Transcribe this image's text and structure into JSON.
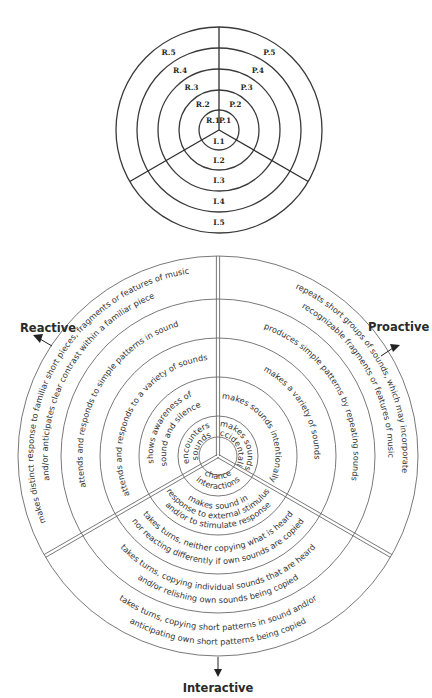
{
  "top_diagram": {
    "center": [
      219,
      130
    ],
    "radii": [
      103,
      82,
      61,
      40,
      20
    ],
    "ring_fills": [
      "#f4f4f4",
      "#ebebeb",
      "#e0e0e0",
      "#d4d4d4",
      "#c9c9c9"
    ],
    "labels": {
      "R": [
        "R.1",
        "R.2",
        "R.3",
        "R.4",
        "R.5"
      ],
      "P": [
        "P.1",
        "P.2",
        "P.3",
        "P.4",
        "P.5"
      ],
      "I": [
        "I.1",
        "I.2",
        "I.3",
        "I.4",
        "I.5"
      ]
    }
  },
  "bottom_diagram": {
    "center": [
      218,
      456
    ],
    "radii": [
      200,
      157,
      118,
      79,
      40,
      19
    ],
    "axes": {
      "reactive": "Reactive",
      "proactive": "Proactive",
      "interactive": "Interactive"
    },
    "reactive_levels": [
      "encounters sounds",
      "shows awareness of sound and silence",
      "attends and responds to a variety of sounds",
      "attends and responds to simple patterns in sound",
      "makes distinct response to familiar short pieces, fragments or features of music and/or anticipates clear contrast within a familiar piece"
    ],
    "reactive_lines": [
      [
        "encounters",
        "sounds"
      ],
      [
        "shows awareness of",
        "sound and silence"
      ],
      [
        "attends and responds to a variety of sounds"
      ],
      [
        "attends and responds to simple patterns in sound"
      ],
      [
        "makes distinct response to familiar short pieces, fragments or features of music",
        "and/or anticipates clear contrast within a familiar piece"
      ]
    ],
    "proactive_levels": [
      "makes sounds accidentally",
      "makes sounds intentionally",
      "makes a variety of sounds",
      "produces simple patterns by repeating sounds",
      "repeats short groups of sounds, which may incorporate recognizable fragments or features of music"
    ],
    "proactive_lines": [
      [
        "makes sounds",
        "accidentally"
      ],
      [
        "makes sounds intentionally"
      ],
      [
        "makes a variety of sounds"
      ],
      [
        "produces simple patterns by repeating sounds"
      ],
      [
        "repeats short groups of sounds, which may incorporate",
        "recognizable fragments or features of music"
      ]
    ],
    "interactive_levels": [
      "chance interactions",
      "makes sound in response to external stimulus and/or to stimulate response",
      "takes turns, neither copying what is heard nor reacting differently if own sounds are copied",
      "takes turns, copying individual sounds that are heard and/or relishing own sounds being copied",
      "takes turns, copying short patterns in sound and/or anticipating own short patterns being copied"
    ],
    "interactive_lines": [
      [
        "chance",
        "interactions"
      ],
      [
        "makes sound in",
        "response to external stimulus",
        "and/or to stimulate response"
      ],
      [
        "takes turns, neither copying what is heard",
        "nor reacting differently if own sounds are copied"
      ],
      [
        "takes turns, copying individual sounds that are heard",
        "and/or relishing own sounds being copied"
      ],
      [
        "takes turns, copying short patterns in sound and/or",
        "anticipating own short patterns being copied"
      ]
    ]
  }
}
